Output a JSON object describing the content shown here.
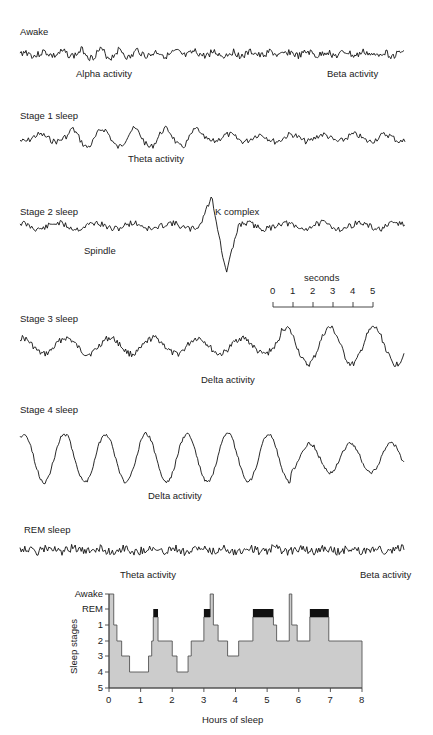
{
  "figure": {
    "traces": [
      {
        "id": "awake",
        "title": "Awake",
        "annotations": [
          "Alpha activity",
          "Beta activity"
        ]
      },
      {
        "id": "stage1",
        "title": "Stage 1 sleep",
        "annotations": [
          "Theta activity"
        ]
      },
      {
        "id": "stage2",
        "title": "Stage 2 sleep",
        "annotations": [
          "Spindle",
          "K complex"
        ]
      },
      {
        "id": "stage3",
        "title": "Stage 3 sleep",
        "annotations": [
          "Delta activity"
        ]
      },
      {
        "id": "stage4",
        "title": "Stage 4 sleep",
        "annotations": [
          "Delta activity"
        ]
      },
      {
        "id": "rem",
        "title": "REM sleep",
        "annotations": [
          "Theta activity",
          "Beta activity"
        ]
      }
    ],
    "scale_bar": {
      "label": "seconds",
      "ticks": [
        "0",
        "1",
        "2",
        "3",
        "4",
        "5"
      ]
    }
  },
  "chart_data": {
    "type": "area",
    "title": "",
    "xlabel": "Hours of sleep",
    "ylabel": "Sleep stages",
    "x_ticks": [
      "0",
      "1",
      "2",
      "3",
      "4",
      "5",
      "6",
      "7",
      "8"
    ],
    "y_ticks": [
      "Awake",
      "REM",
      "1",
      "2",
      "3",
      "4",
      "5"
    ],
    "xlim": [
      0,
      8
    ],
    "grid": false,
    "legend": "none",
    "fill_color": "#cccccc",
    "rem_color": "#111111",
    "hypnogram": [
      {
        "start": 0.0,
        "end": 0.15,
        "stage": "Awake"
      },
      {
        "start": 0.15,
        "end": 0.25,
        "stage": "1"
      },
      {
        "start": 0.25,
        "end": 0.4,
        "stage": "2"
      },
      {
        "start": 0.4,
        "end": 0.65,
        "stage": "3"
      },
      {
        "start": 0.65,
        "end": 1.25,
        "stage": "4"
      },
      {
        "start": 1.25,
        "end": 1.35,
        "stage": "3"
      },
      {
        "start": 1.35,
        "end": 1.4,
        "stage": "2"
      },
      {
        "start": 1.4,
        "end": 1.55,
        "stage": "REM"
      },
      {
        "start": 1.55,
        "end": 2.0,
        "stage": "2"
      },
      {
        "start": 2.0,
        "end": 2.15,
        "stage": "3"
      },
      {
        "start": 2.15,
        "end": 2.5,
        "stage": "4"
      },
      {
        "start": 2.5,
        "end": 2.6,
        "stage": "3"
      },
      {
        "start": 2.6,
        "end": 3.0,
        "stage": "2"
      },
      {
        "start": 3.0,
        "end": 3.2,
        "stage": "REM"
      },
      {
        "start": 3.2,
        "end": 3.3,
        "stage": "Awake"
      },
      {
        "start": 3.3,
        "end": 3.45,
        "stage": "1"
      },
      {
        "start": 3.45,
        "end": 3.75,
        "stage": "2"
      },
      {
        "start": 3.75,
        "end": 4.1,
        "stage": "3"
      },
      {
        "start": 4.1,
        "end": 4.55,
        "stage": "2"
      },
      {
        "start": 4.55,
        "end": 5.2,
        "stage": "REM"
      },
      {
        "start": 5.2,
        "end": 5.3,
        "stage": "1"
      },
      {
        "start": 5.3,
        "end": 5.7,
        "stage": "2"
      },
      {
        "start": 5.7,
        "end": 5.78,
        "stage": "Awake"
      },
      {
        "start": 5.78,
        "end": 5.95,
        "stage": "1"
      },
      {
        "start": 5.95,
        "end": 6.35,
        "stage": "2"
      },
      {
        "start": 6.35,
        "end": 6.95,
        "stage": "REM"
      },
      {
        "start": 6.95,
        "end": 8.0,
        "stage": "2"
      }
    ]
  }
}
